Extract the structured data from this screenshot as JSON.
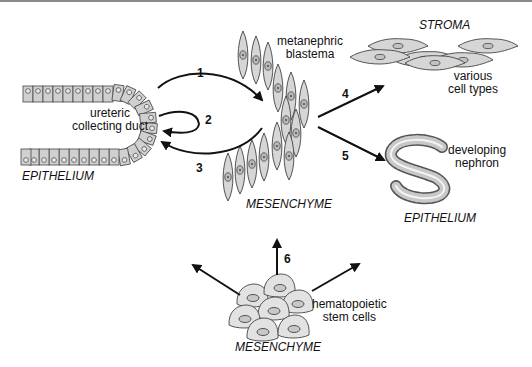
{
  "diagram": {
    "labels": {
      "ureteric_duct": [
        "ureteric",
        "collecting duct"
      ],
      "epithelium_left": "EPITHELIUM",
      "metanephric_blastema": [
        "metanephric",
        "blastema"
      ],
      "mesenchyme_center": "MESENCHYME",
      "stroma": "STROMA",
      "various_cell_types": [
        "various",
        "cell types"
      ],
      "developing_nephron": [
        "developing",
        "nephron"
      ],
      "epithelium_right": "EPITHELIUM",
      "hematopoietic": [
        "hematopoietic",
        "stem cells"
      ],
      "mesenchyme_bottom": "MESENCHYME"
    },
    "arrows": [
      {
        "id": "1",
        "label": "1",
        "from": "ureteric collecting duct",
        "to": "metanephric blastema"
      },
      {
        "id": "2",
        "label": "2",
        "from": "ureteric collecting duct",
        "to": "ureteric collecting duct"
      },
      {
        "id": "3",
        "label": "3",
        "from": "metanephric blastema",
        "to": "ureteric collecting duct"
      },
      {
        "id": "4",
        "label": "4",
        "from": "mesenchyme",
        "to": "stroma"
      },
      {
        "id": "5",
        "label": "5",
        "from": "mesenchyme",
        "to": "developing nephron"
      },
      {
        "id": "6",
        "label": "6",
        "from": "hematopoietic stem cells",
        "to": "mesenchyme"
      }
    ],
    "colors": {
      "cell_fill": "#d4d4d4",
      "stroke": "#333333",
      "arrow": "#111111",
      "top_border": "#8a8a8a"
    }
  }
}
